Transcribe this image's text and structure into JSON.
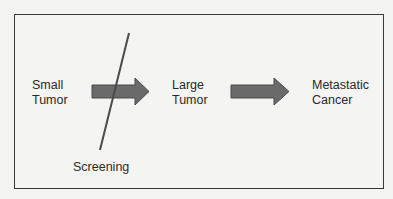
{
  "diagram": {
    "stages": [
      {
        "line1": "Small",
        "line2": "Tumor"
      },
      {
        "line1": "Large",
        "line2": "Tumor"
      },
      {
        "line1": "Metastatic",
        "line2": "Cancer"
      }
    ],
    "intervention": {
      "label": "Screening"
    },
    "colors": {
      "arrow": "#6a6a6a",
      "line": "#4a4a4a",
      "border": "#3a3a3a",
      "text": "#2a2a2a"
    }
  }
}
